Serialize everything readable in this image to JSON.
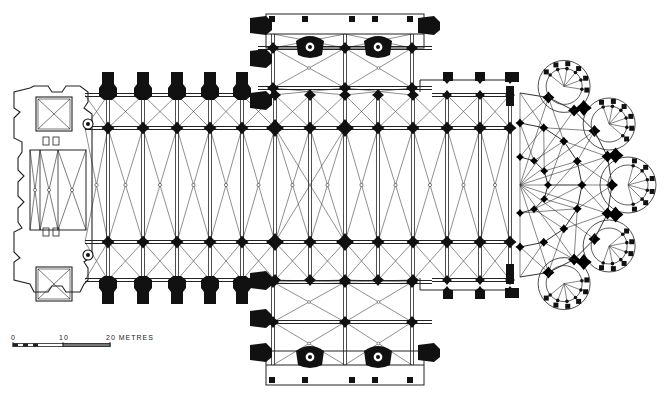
{
  "figure": {
    "type": "architectural-floor-plan"
  },
  "scale_bar": {
    "labels": [
      "0",
      "10",
      "20 METRES"
    ],
    "label_0": "0",
    "label_10": "10",
    "label_20": "20 METRES",
    "x0": 13,
    "x10": 63,
    "x20": 110,
    "y": 345
  },
  "colors": {
    "ink": "#111111",
    "line": "#333333",
    "paper": "#ffffff"
  },
  "layout": {
    "nave": {
      "x1": 85,
      "x2": 512,
      "arcade_n": 128,
      "arcade_s": 242,
      "wall_n": 95,
      "wall_s": 280,
      "center_y": 185
    },
    "nave_piers_x": [
      108,
      143,
      177,
      210,
      242,
      275,
      310,
      345,
      378,
      413,
      447,
      480,
      510
    ],
    "buttress_x_west": [
      108,
      143,
      177,
      210,
      242
    ],
    "transept": {
      "x1": 258,
      "x2": 432,
      "y_n": 14,
      "y_s": 385,
      "bays_y_n": [
        48,
        88
      ],
      "bays_y_s": [
        282,
        322,
        352
      ]
    },
    "choir_aisle_piers_x": [
      447,
      480
    ],
    "chevet": {
      "cx": 520,
      "cy": 185
    },
    "west_front": {
      "x1": 12,
      "x2": 88,
      "tower_n_y": 85,
      "tower_s_y": 255
    }
  }
}
